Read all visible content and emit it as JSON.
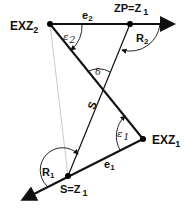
{
  "diagram": {
    "points": {
      "exz2": {
        "label": "EXZ",
        "sub": "2"
      },
      "zp": {
        "label": "ZP=Z",
        "sub": "1"
      },
      "exz1": {
        "label": "EXZ",
        "sub": "1"
      },
      "s": {
        "label": "S=Z",
        "sub": "1"
      }
    },
    "angles": {
      "e2": {
        "label": "e",
        "sub": "2"
      },
      "eps2": {
        "label": "ε",
        "sub": "2"
      },
      "r2": {
        "label": "R",
        "sub": "2"
      },
      "delta": {
        "label": "δ"
      },
      "s_line": {
        "label": "S"
      },
      "eps1": {
        "label": "ε",
        "sub": "1"
      },
      "e1": {
        "label": "e",
        "sub": "1"
      },
      "r1": {
        "label": "R",
        "sub": "1"
      }
    },
    "colors": {
      "line": "#111111",
      "thin_line": "#bbbbbb"
    }
  }
}
